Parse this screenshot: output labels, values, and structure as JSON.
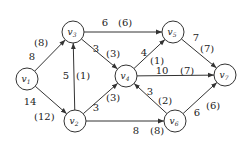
{
  "diagram": {
    "type": "network-flow",
    "colors": {
      "stroke": "#333333",
      "text": "#222222",
      "background": "#ffffff"
    },
    "nodes": [
      {
        "id": "v1",
        "base": "v",
        "sub": "1",
        "x": 27,
        "y": 79
      },
      {
        "id": "v2",
        "base": "v",
        "sub": "2",
        "x": 75,
        "y": 121
      },
      {
        "id": "v3",
        "base": "v",
        "sub": "3",
        "x": 73,
        "y": 32
      },
      {
        "id": "v4",
        "base": "v",
        "sub": "4",
        "x": 126,
        "y": 76
      },
      {
        "id": "v5",
        "base": "v",
        "sub": "5",
        "x": 173,
        "y": 32
      },
      {
        "id": "v6",
        "base": "v",
        "sub": "6",
        "x": 175,
        "y": 121
      },
      {
        "id": "v7",
        "base": "v",
        "sub": "7",
        "x": 225,
        "y": 75
      }
    ],
    "edges": [
      {
        "from": "v1",
        "to": "v3",
        "capacity": "8",
        "flow": "(8)",
        "cap_pos": [
          32,
          60
        ],
        "flow_pos": [
          34,
          46
        ]
      },
      {
        "from": "v1",
        "to": "v2",
        "capacity": "14",
        "flow": "(12)",
        "cap_pos": [
          30,
          105
        ],
        "flow_pos": [
          34,
          120
        ]
      },
      {
        "from": "v2",
        "to": "v3",
        "capacity": "5",
        "flow": "(1)",
        "cap_pos": [
          66,
          79
        ],
        "flow_pos": [
          76,
          79
        ]
      },
      {
        "from": "v3",
        "to": "v5",
        "capacity": "6",
        "flow": "(6)",
        "cap_pos": [
          105,
          26
        ],
        "flow_pos": [
          118,
          26
        ]
      },
      {
        "from": "v3",
        "to": "v4",
        "capacity": "3",
        "flow": "(3)",
        "cap_pos": [
          96,
          52
        ],
        "flow_pos": [
          106,
          57
        ]
      },
      {
        "from": "v2",
        "to": "v4",
        "capacity": "3",
        "flow": "(3)",
        "cap_pos": [
          96,
          111
        ],
        "flow_pos": [
          106,
          101
        ]
      },
      {
        "from": "v4",
        "to": "v5",
        "capacity": "4",
        "flow": "(1)",
        "cap_pos": [
          144,
          56
        ],
        "flow_pos": [
          150,
          64
        ]
      },
      {
        "from": "v4",
        "to": "v7",
        "capacity": "10",
        "flow": "(7)",
        "cap_pos": [
          162,
          74
        ],
        "flow_pos": [
          180,
          74
        ]
      },
      {
        "from": "v5",
        "to": "v7",
        "capacity": "7",
        "flow": "(7)",
        "cap_pos": [
          196,
          41
        ],
        "flow_pos": [
          200,
          52
        ]
      },
      {
        "from": "v6",
        "to": "v4",
        "capacity": "3",
        "flow": "(2)",
        "cap_pos": [
          150,
          95
        ],
        "flow_pos": [
          158,
          104
        ]
      },
      {
        "from": "v2",
        "to": "v6",
        "capacity": "8",
        "flow": "(8)",
        "cap_pos": [
          136,
          134
        ],
        "flow_pos": [
          150,
          134
        ]
      },
      {
        "from": "v6",
        "to": "v7",
        "capacity": "6",
        "flow": "(6)",
        "cap_pos": [
          197,
          116
        ],
        "flow_pos": [
          206,
          109
        ]
      }
    ]
  }
}
